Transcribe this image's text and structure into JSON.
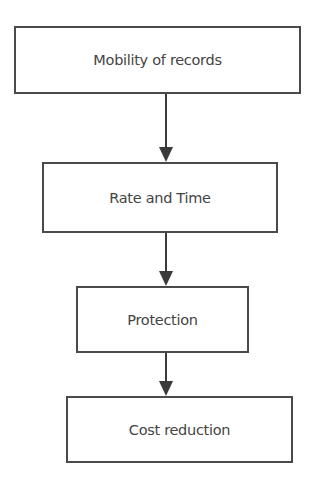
{
  "diagram": {
    "type": "flowchart",
    "direction": "top-to-bottom",
    "colors": {
      "border": "#4a4a4a",
      "text": "#444444",
      "arrow": "#3a3a3a",
      "background": "#ffffff"
    },
    "nodes": [
      {
        "id": "n1",
        "label": "Mobility of records"
      },
      {
        "id": "n2",
        "label": "Rate and Time"
      },
      {
        "id": "n3",
        "label": "Protection"
      },
      {
        "id": "n4",
        "label": "Cost reduction"
      }
    ],
    "edges": [
      {
        "from": "n1",
        "to": "n2"
      },
      {
        "from": "n2",
        "to": "n3"
      },
      {
        "from": "n3",
        "to": "n4"
      }
    ]
  }
}
